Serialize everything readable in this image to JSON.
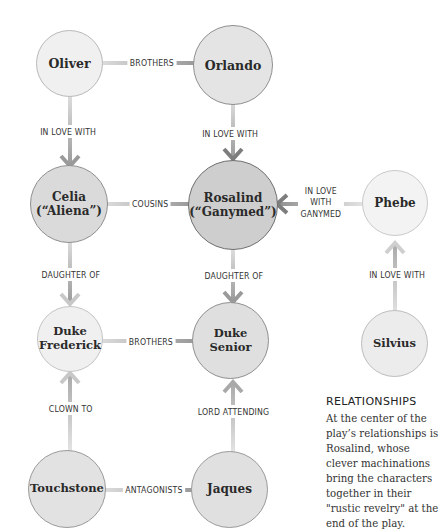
{
  "nodes": {
    "oliver": {
      "label": "Oliver"
    },
    "orlando": {
      "label": "Orlando"
    },
    "celia": {
      "line1": "Celia",
      "line2": "(“Aliena”)"
    },
    "rosalind": {
      "line1": "Rosalind",
      "line2": "(“Ganymed”)"
    },
    "phebe": {
      "label": "Phebe"
    },
    "frederick": {
      "line1": "Duke",
      "line2": "Frederick"
    },
    "senior": {
      "label": "Duke Senior"
    },
    "silvius": {
      "label": "Silvius"
    },
    "touchstone": {
      "label": "Touchstone"
    },
    "jaques": {
      "label": "Jaques"
    }
  },
  "relationships": {
    "oliver_orlando": "BROTHERS",
    "oliver_celia": "IN LOVE WITH",
    "orlando_rosalind": "IN LOVE WITH",
    "celia_rosalind": "COUSINS",
    "phebe_rosalind": {
      "line1": "IN LOVE",
      "line2": "WITH",
      "line3": "GANYMED"
    },
    "celia_frederick": "DAUGHTER OF",
    "rosalind_senior": "DAUGHTER OF",
    "silvius_phebe": "IN LOVE WITH",
    "frederick_senior": "BROTHERS",
    "touchstone_frederick": "CLOWN TO",
    "jaques_senior": "LORD ATTENDING",
    "touchstone_jaques": "ANTAGONISTS"
  },
  "sidebar": {
    "title": "RELATIONSHIPS",
    "body": "At the center of the play’s relationships is Rosalind, whose clever machinations bring the characters together in their \"rustic revelry\" at the end of the play."
  },
  "colors": {
    "light_node": "#efefef",
    "mid_node": "#dcdcdc",
    "dark_node": "#cfcfcf",
    "node_border": "#8f8f8f",
    "link": "#a9a9a9",
    "arrow": "#8c8c8c"
  }
}
